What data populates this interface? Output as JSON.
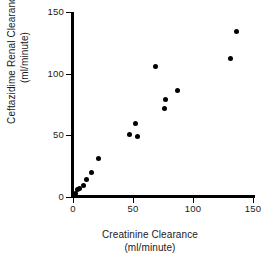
{
  "chart_data": {
    "type": "scatter",
    "title": "",
    "xlabel": "Creatinine Clearance",
    "xlabel_units": "(ml/minute)",
    "ylabel": "Ceftazidime Renal Clearance",
    "ylabel_units": "(ml/minute)",
    "xlim": [
      0,
      150
    ],
    "ylim": [
      0,
      150
    ],
    "xticks": [
      0,
      50,
      100,
      150
    ],
    "yticks": [
      0,
      50,
      100,
      150
    ],
    "xtick_labels": [
      "0",
      "50",
      "100",
      "150"
    ],
    "ytick_labels": [
      "0",
      "50",
      "100",
      "150"
    ],
    "grid": false,
    "legend": false,
    "marker": "filled-circle",
    "marker_color": "#000000",
    "points": [
      {
        "x": 2,
        "y": 3
      },
      {
        "x": 4,
        "y": 6
      },
      {
        "x": 5,
        "y": 7
      },
      {
        "x": 9,
        "y": 9
      },
      {
        "x": 11,
        "y": 14
      },
      {
        "x": 15,
        "y": 20
      },
      {
        "x": 21,
        "y": 31
      },
      {
        "x": 47,
        "y": 51
      },
      {
        "x": 52,
        "y": 60
      },
      {
        "x": 54,
        "y": 49
      },
      {
        "x": 69,
        "y": 106
      },
      {
        "x": 76,
        "y": 72
      },
      {
        "x": 77,
        "y": 79
      },
      {
        "x": 87,
        "y": 86
      },
      {
        "x": 131,
        "y": 112
      },
      {
        "x": 136,
        "y": 134
      }
    ]
  },
  "axes": {
    "axis_color": "#000000"
  }
}
